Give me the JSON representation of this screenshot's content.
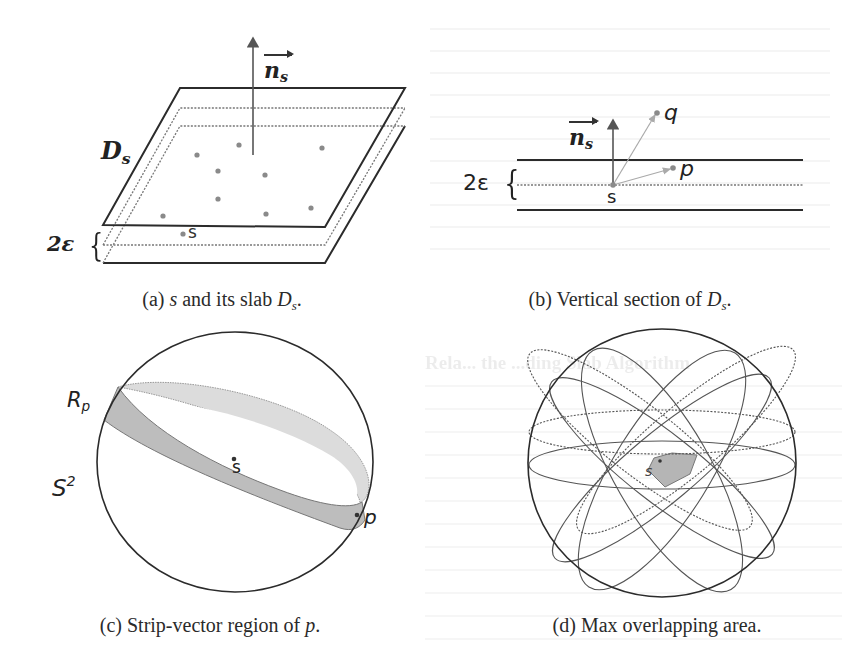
{
  "figure": {
    "panels": [
      {
        "id": "a",
        "caption_prefix": "(a) ",
        "caption_math_1": "s",
        "caption_mid": " and its slab ",
        "caption_math_2": "D",
        "caption_math_2_sub": "s",
        "caption_suffix": ".",
        "labels": {
          "normal_vector": "n",
          "normal_vector_sub": "s",
          "slab": "D",
          "slab_sub": "s",
          "thickness": "2ε",
          "thickness_brace": "{",
          "point": "s"
        }
      },
      {
        "id": "b",
        "caption_prefix": "(b) Vertical section of ",
        "caption_math": "D",
        "caption_math_sub": "s",
        "caption_suffix": ".",
        "labels": {
          "normal_vector": "n",
          "normal_vector_sub": "s",
          "thickness": "2ε",
          "thickness_brace": "{",
          "point_s": "s",
          "point_p": "p",
          "point_q": "q"
        }
      },
      {
        "id": "c",
        "caption_prefix": "(c) Strip-vector region of ",
        "caption_math": "p",
        "caption_suffix": ".",
        "labels": {
          "region": "R",
          "region_sub": "p",
          "sphere": "S",
          "sphere_sup": "2",
          "point_s": "s",
          "point_p": "p"
        }
      },
      {
        "id": "d",
        "caption": "(d) Max overlapping area.",
        "labels": {
          "point_s": "s"
        }
      }
    ],
    "colors": {
      "line": "#2b2b2b",
      "dot": "#8a8a8a",
      "strip_dark": "#b9b9b9",
      "strip_light": "#dcdcdc",
      "overlap_fill": "#b5b5b5"
    }
  },
  "bleed_through_text": {
    "heading_fragment": "Rela... the ...ding Slab Algorithm"
  }
}
